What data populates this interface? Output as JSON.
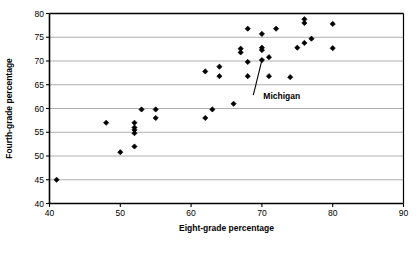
{
  "chart_data": {
    "type": "scatter",
    "title": "",
    "xlabel": "Eight-grade percentage",
    "ylabel": "Fourth-grade percentage",
    "xlim": [
      40,
      90
    ],
    "ylim": [
      40,
      80
    ],
    "xticks": [
      40,
      50,
      60,
      70,
      80,
      90
    ],
    "yticks": [
      40,
      45,
      50,
      55,
      60,
      65,
      70,
      75,
      80
    ],
    "xtick_labels": [
      "40",
      "50",
      "60",
      "70",
      "80",
      "90"
    ],
    "ytick_labels": [
      "40",
      "45",
      "50",
      "55",
      "60",
      "65",
      "70",
      "75",
      "80"
    ],
    "grid": "horizontal",
    "legend": "none",
    "marker": "diamond",
    "marker_color": "#000000",
    "series": [
      {
        "name": "States",
        "points": [
          [
            41.0,
            45.0
          ],
          [
            48.0,
            57.0
          ],
          [
            50.0,
            50.8
          ],
          [
            52.0,
            52.0
          ],
          [
            52.0,
            54.8
          ],
          [
            52.0,
            55.5
          ],
          [
            52.0,
            56.0
          ],
          [
            52.0,
            57.0
          ],
          [
            53.0,
            59.8
          ],
          [
            55.0,
            58.0
          ],
          [
            55.0,
            59.8
          ],
          [
            62.0,
            58.0
          ],
          [
            62.0,
            67.8
          ],
          [
            63.0,
            59.8
          ],
          [
            64.0,
            66.8
          ],
          [
            64.0,
            68.8
          ],
          [
            66.0,
            61.0
          ],
          [
            67.0,
            71.8
          ],
          [
            67.0,
            72.6
          ],
          [
            68.0,
            66.8
          ],
          [
            68.0,
            69.8
          ],
          [
            68.0,
            76.8
          ],
          [
            70.0,
            70.2
          ],
          [
            70.0,
            72.3
          ],
          [
            70.0,
            72.8
          ],
          [
            70.0,
            75.7
          ],
          [
            71.0,
            66.8
          ],
          [
            71.0,
            70.8
          ],
          [
            72.0,
            76.8
          ],
          [
            74.0,
            66.6
          ],
          [
            75.0,
            72.8
          ],
          [
            76.0,
            78.0
          ],
          [
            76.0,
            78.8
          ],
          [
            76.0,
            73.8
          ],
          [
            77.0,
            74.7
          ],
          [
            80.0,
            72.7
          ],
          [
            80.0,
            77.8
          ]
        ]
      }
    ],
    "annotations": [
      {
        "text": "Michigan",
        "point": [
          70.0,
          70.2
        ],
        "label_x": 70.2,
        "label_y": 62.2
      }
    ]
  },
  "axes": {
    "x_title": "Eight-grade percentage",
    "y_title": "Fourth-grade percentage"
  },
  "colors": {
    "axis": "#000000",
    "grid": "#a6a6a6",
    "marker": "#000000",
    "background": "#ffffff"
  }
}
